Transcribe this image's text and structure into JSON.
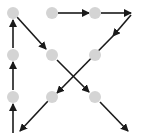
{
  "diagram": {
    "dot_color": "#d4d4d4",
    "line_color": "#1a1a1a",
    "dot_radius": 6,
    "dots": [
      {
        "id": "r1c1",
        "x": 13,
        "y": 13
      },
      {
        "id": "r1c2",
        "x": 52,
        "y": 13
      },
      {
        "id": "r1c3",
        "x": 95,
        "y": 13
      },
      {
        "id": "r2c1",
        "x": 13,
        "y": 55
      },
      {
        "id": "r2c2",
        "x": 52,
        "y": 55
      },
      {
        "id": "r2c3",
        "x": 95,
        "y": 55
      },
      {
        "id": "r3c1",
        "x": 13,
        "y": 97
      },
      {
        "id": "r3c2",
        "x": 52,
        "y": 97
      },
      {
        "id": "r3c3",
        "x": 95,
        "y": 97
      }
    ],
    "arrows": [
      {
        "from": [
          58,
          13
        ],
        "to": [
          89,
          13
        ]
      },
      {
        "from": [
          101,
          13
        ],
        "to": [
          131,
          13
        ]
      },
      {
        "from": [
          131,
          15
        ],
        "to": [
          113,
          36
        ]
      },
      {
        "from": [
          113,
          36
        ],
        "to": [
          57,
          93
        ]
      },
      {
        "from": [
          48,
          101
        ],
        "to": [
          20,
          131
        ]
      },
      {
        "from": [
          13,
          133
        ],
        "to": [
          13,
          104
        ]
      },
      {
        "from": [
          13,
          90
        ],
        "to": [
          13,
          62
        ]
      },
      {
        "from": [
          13,
          48
        ],
        "to": [
          13,
          20
        ]
      },
      {
        "from": [
          17,
          17
        ],
        "to": [
          46,
          49
        ]
      },
      {
        "from": [
          57,
          60
        ],
        "to": [
          89,
          92
        ]
      },
      {
        "from": [
          100,
          102
        ],
        "to": [
          128,
          131
        ]
      }
    ]
  }
}
